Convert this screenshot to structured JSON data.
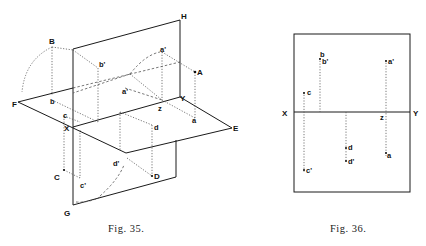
{
  "figures": [
    {
      "id": "fig35",
      "caption": "Fig. 35.",
      "description": "Isometric view of horizontal and vertical planes of projection with points A, B, C, D and their projections",
      "labels": {
        "H": "H",
        "B": "B",
        "A": "A",
        "F": "F",
        "E": "E",
        "X": "X",
        "Y": "Y",
        "G": "G",
        "C": "C",
        "D": "D",
        "b": "b",
        "b_prime": "b'",
        "a": "a",
        "a_prime": "a'",
        "c": "c",
        "c_prime": "c'",
        "d": "d",
        "d_prime": "d'",
        "z": "z"
      }
    },
    {
      "id": "fig36",
      "caption": "Fig. 36.",
      "description": "Orthographic projection of points on a single plane with ground line XY",
      "labels": {
        "X": "X",
        "Y": "Y",
        "z": "z",
        "b": "b",
        "b_prime": "b'",
        "a_prime": "a'",
        "c": "c",
        "a": "a",
        "d": "d",
        "d_prime": "d'",
        "c_prime": "c'"
      }
    }
  ]
}
